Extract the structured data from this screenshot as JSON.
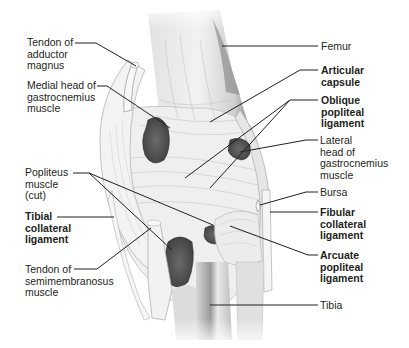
{
  "figure": {
    "colors": {
      "background": "#ffffff",
      "text": "#231f20",
      "leader_line": "#231f20",
      "tissue_light": "#eeeeee",
      "tissue_mid": "#c9c9c9",
      "muscle_cut": "#5a5a5a"
    }
  },
  "labels": {
    "left": [
      {
        "id": "tendon-adductor-magnus",
        "text": "Tendon of\nadductor\nmagnus",
        "bold": false
      },
      {
        "id": "medial-head-gastrocnemius",
        "text": "Medial head of\ngastrocnemius\nmuscle",
        "bold": false
      },
      {
        "id": "popliteus-muscle",
        "text": "Popliteus\nmuscle\n(cut)",
        "bold": false
      },
      {
        "id": "tibial-collateral-ligament",
        "text": "Tibial\ncollateral\nligament",
        "bold": true
      },
      {
        "id": "tendon-semimembranosus",
        "text": "Tendon of\nsemimembranosus\nmuscle",
        "bold": false
      }
    ],
    "right": [
      {
        "id": "femur",
        "text": "Femur",
        "bold": false
      },
      {
        "id": "articular-capsule",
        "text": "Articular\ncapsule",
        "bold": true
      },
      {
        "id": "oblique-popliteal-ligament",
        "text": "Oblique\npopliteal\nligament",
        "bold": true
      },
      {
        "id": "lateral-head-gastrocnemius",
        "text": "Lateral\nhead of\ngastrocnemius\nmuscle",
        "bold": false
      },
      {
        "id": "bursa",
        "text": "Bursa",
        "bold": false
      },
      {
        "id": "fibular-collateral-ligament",
        "text": "Fibular\ncollateral\nligament",
        "bold": true
      },
      {
        "id": "arcuate-popliteal-ligament",
        "text": "Arcuate\npopliteal\nligament",
        "bold": true
      },
      {
        "id": "tibia",
        "text": "Tibia",
        "bold": false
      }
    ]
  }
}
